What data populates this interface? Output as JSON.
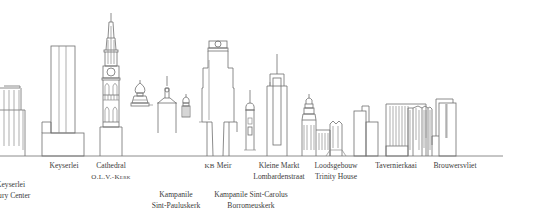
{
  "illustration": {
    "type": "city skyline line drawing",
    "colors": {
      "line": "#6e6e6e",
      "ground": "#8c8c8c",
      "text": "#3c3c3c",
      "background": "#ffffff"
    },
    "ground_line_y": 156
  },
  "landmarks": [
    {
      "id": "keyserlei-century-center",
      "lines": [
        "Keyserlei",
        "Century Center"
      ],
      "visible_lines": [
        "Keyserlei",
        "tury Center"
      ],
      "row": 2
    },
    {
      "id": "keyserlei",
      "lines": [
        "Keyserlei"
      ],
      "row": 1
    },
    {
      "id": "cathedral",
      "lines": [
        "Cathedral",
        "O.L.V.-Kerk"
      ],
      "row": 1
    },
    {
      "id": "kampanile-sint-pauluskerk",
      "lines": [
        "Kampanile",
        "Sint-Pauluskerk"
      ],
      "row": 2
    },
    {
      "id": "kb-meir",
      "prefix": "KB",
      "lines": [
        "Meir"
      ],
      "row": 1
    },
    {
      "id": "kampanile-sint-carolus",
      "lines": [
        "Kampanile Sint-Carolus",
        "Borromeuskerk"
      ],
      "row": 2
    },
    {
      "id": "kleine-markt",
      "lines": [
        "Kleine Markt",
        "Lombardenstraat"
      ],
      "row": 1
    },
    {
      "id": "loodsgebouw",
      "lines": [
        "Loodsgebouw",
        "Trinity House"
      ],
      "row": 1
    },
    {
      "id": "tavernierkaai",
      "lines": [
        "Tavernierkaai"
      ],
      "row": 1
    },
    {
      "id": "brouwersvliet",
      "lines": [
        "Brouwersvliet"
      ],
      "row": 1
    }
  ]
}
